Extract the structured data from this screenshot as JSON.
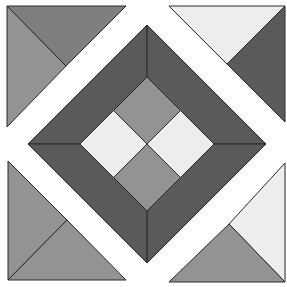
{
  "colors": {
    "background": "#ffffff",
    "dark": "#5a5a5a",
    "medium_dark": "#7e7e7e",
    "medium": "#939393",
    "light": "#ededed",
    "outline": "#2a2a2a"
  },
  "pieces": [
    {
      "name": "corner-top-left-upper-triangle",
      "shade": "medium_dark"
    },
    {
      "name": "corner-top-left-lower-triangle",
      "shade": "medium"
    },
    {
      "name": "corner-top-right-upper-triangle",
      "shade": "light"
    },
    {
      "name": "corner-top-right-lower-triangle",
      "shade": "dark"
    },
    {
      "name": "corner-bottom-left-side-triangle",
      "shade": "medium"
    },
    {
      "name": "corner-bottom-left-bottom-triangle",
      "shade": "medium"
    },
    {
      "name": "corner-bottom-right-side-triangle",
      "shade": "light"
    },
    {
      "name": "corner-bottom-right-bottom-triangle",
      "shade": "medium"
    },
    {
      "name": "frame-top-left",
      "shade": "dark"
    },
    {
      "name": "frame-top-right",
      "shade": "dark"
    },
    {
      "name": "frame-bottom-right",
      "shade": "dark"
    },
    {
      "name": "frame-bottom-left",
      "shade": "dark"
    },
    {
      "name": "center-top-square",
      "shade": "medium"
    },
    {
      "name": "center-right-square",
      "shade": "light"
    },
    {
      "name": "center-bottom-square",
      "shade": "medium"
    },
    {
      "name": "center-left-square",
      "shade": "light"
    }
  ]
}
